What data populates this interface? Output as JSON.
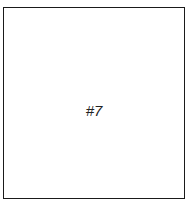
{
  "panel": {
    "label": "#7",
    "border_color": "#1a1a1a",
    "background": "#ffffff"
  }
}
